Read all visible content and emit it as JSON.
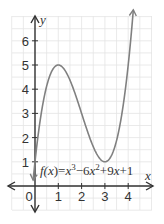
{
  "chart_data": {
    "type": "line",
    "title": "",
    "xlabel": "x",
    "ylabel": "y",
    "equation": {
      "prefix": "f(x)",
      "equals": "=",
      "body": "x³ − 6x² + 9x + 1",
      "parts": [
        "f(",
        "x",
        ")=",
        "x",
        "3",
        "−6",
        "x",
        "2",
        "+9",
        "x",
        "+1"
      ]
    },
    "xlim": [
      -1,
      5
    ],
    "ylim": [
      -1,
      7
    ],
    "x_ticks": [
      0,
      1,
      2,
      3,
      4
    ],
    "x_tick_labels": [
      "0",
      "1",
      "2",
      "3",
      "4"
    ],
    "y_ticks": [
      1,
      2,
      3,
      4,
      5,
      6
    ],
    "y_tick_labels": [
      "1",
      "2",
      "3",
      "4",
      "5",
      "6"
    ],
    "grid": true,
    "series": [
      {
        "name": "f(x) = x^3 - 6x^2 + 9x + 1",
        "function": "x^3 - 6x^2 + 9x + 1",
        "x": [
          -0.2,
          0,
          0.5,
          1,
          1.5,
          2,
          2.5,
          3,
          3.5,
          4,
          4.3
        ],
        "values": [
          -0.93,
          1,
          4.13,
          5,
          4.38,
          3,
          1.63,
          1,
          1.88,
          5,
          8.44
        ],
        "color": "#808080"
      }
    ],
    "annotations": [
      {
        "label": "local maximum",
        "x": 1,
        "y": 5
      },
      {
        "label": "local minimum",
        "x": 3,
        "y": 1
      }
    ]
  },
  "colors": {
    "grid": "#e4e4e4",
    "axis": "#333333",
    "curve": "#808080"
  }
}
